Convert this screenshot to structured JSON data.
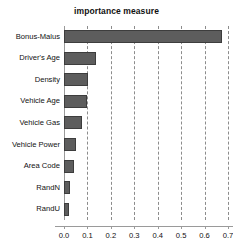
{
  "chart_data": {
    "type": "bar",
    "orientation": "horizontal",
    "title": "importance measure",
    "xlabel": "",
    "ylabel": "",
    "categories": [
      "Bonus-Malus",
      "Driver's Age",
      "Density",
      "Vehicle Age",
      "Vehicle Gas",
      "Vehicle Power",
      "Area Code",
      "RandN",
      "RandU"
    ],
    "values": [
      0.676,
      0.137,
      0.103,
      0.098,
      0.077,
      0.051,
      0.043,
      0.026,
      0.021
    ],
    "xlim": [
      0.0,
      0.72
    ],
    "xticks": [
      0.0,
      0.1,
      0.2,
      0.3,
      0.4,
      0.5,
      0.6,
      0.7
    ],
    "xticklabels": [
      "0.0",
      "0.1",
      "0.2",
      "0.3",
      "0.4",
      "0.5",
      "0.6",
      "0.7"
    ],
    "grid": "vertical-dashed",
    "legend": null,
    "bar_color": "#5d5d5d",
    "bar_edge_color": "#3d3d3d",
    "grid_color": "#8c8c8c",
    "axis_color": "#9a9a9a",
    "text_color": "#111111",
    "background": "#ffffff"
  },
  "display": {
    "title": "importance measure"
  }
}
